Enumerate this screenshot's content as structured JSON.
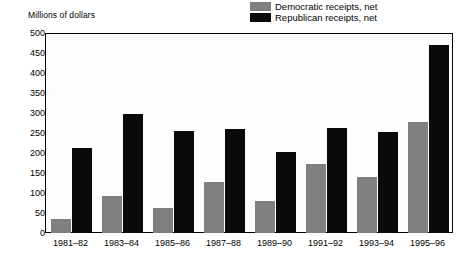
{
  "axis_caption": "Millions of dollars",
  "legend": {
    "position": "top-right",
    "items": [
      {
        "label": "Democratic receipts, net",
        "swatch": "gray-swatch-icon",
        "color": "#808080"
      },
      {
        "label": "Republican receipts, net",
        "swatch": "black-swatch-icon",
        "color": "#0a0a0a"
      }
    ]
  },
  "chart_data": {
    "type": "bar",
    "title": "",
    "subtitle": "",
    "xlabel": "",
    "ylabel": "Millions of dollars",
    "ylim": [
      0,
      500
    ],
    "ytick_step": 50,
    "yticks": [
      0,
      50,
      100,
      150,
      200,
      250,
      300,
      350,
      400,
      450,
      500
    ],
    "ytick_labels": [
      "0",
      "50",
      "100",
      "150",
      "200",
      "250",
      "300",
      "350",
      "400",
      "450",
      "500"
    ],
    "grid": false,
    "legend_position": "top-right",
    "categories": [
      "1981–82",
      "1983–84",
      "1985–86",
      "1987–88",
      "1989–90",
      "1991–92",
      "1993–94",
      "1995–96"
    ],
    "series": [
      {
        "name": "Democratic receipts, net",
        "color": "#808080",
        "values": [
          35,
          92,
          62,
          128,
          81,
          172,
          140,
          277
        ]
      },
      {
        "name": "Republican receipts, net",
        "color": "#0a0a0a",
        "values": [
          212,
          297,
          255,
          260,
          202,
          262,
          252,
          470
        ]
      }
    ]
  }
}
